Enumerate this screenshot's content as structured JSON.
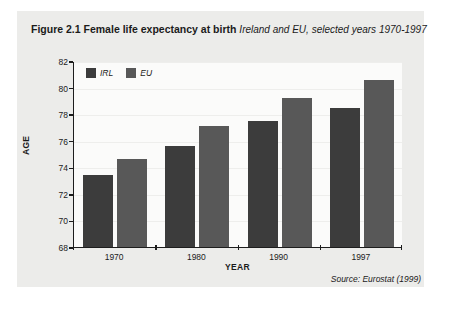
{
  "figure": {
    "number_label": "Figure 2.1",
    "title": "Female life expectancy at birth",
    "subtitle": "Ireland and EU, selected years 1970-1997",
    "source_note": "Source: Eurostat (1999)",
    "panel_bg": "#ececea",
    "plot_bg": "#fbfbfa",
    "axis_color": "#1d1d1d"
  },
  "chart_data": {
    "type": "bar",
    "title": "Female life expectancy at birth",
    "subtitle": "Ireland and EU, selected years 1970-1997",
    "xlabel": "YEAR",
    "ylabel": "AGE",
    "categories": [
      "1970",
      "1980",
      "1990",
      "1997"
    ],
    "series": [
      {
        "name": "IRL",
        "color": "#3c3c3c",
        "values": [
          73.4,
          75.6,
          77.5,
          78.5
        ]
      },
      {
        "name": "EU",
        "color": "#585858",
        "values": [
          74.6,
          77.1,
          79.2,
          80.6
        ]
      }
    ],
    "ylim": [
      68,
      82
    ],
    "yticks": [
      68,
      70,
      72,
      74,
      76,
      78,
      80,
      82
    ],
    "ytick_labels": [
      "68",
      "70",
      "72",
      "74",
      "76",
      "78",
      "80",
      "82"
    ],
    "grid": true,
    "legend_position": "top-left",
    "source": "Source: Eurostat (1999)"
  }
}
